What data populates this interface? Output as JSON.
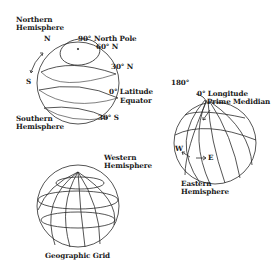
{
  "diagram": {
    "latitude_globe": {
      "northern_hemisphere_line1": "Northern",
      "northern_hemisphere_line2": "Hemisphere",
      "n_label": "N",
      "s_label": "S",
      "north_pole_deg": "90°",
      "north_pole": "North Pole",
      "lat_60": "60° N",
      "lat_30n": "30° N",
      "equator_deg": "0° Latitude",
      "equator": "Equator",
      "lat_30s": "30° S",
      "southern_hemisphere_line1": "Southern",
      "southern_hemisphere_line2": "Hemisphere"
    },
    "longitude_globe": {
      "lon_180": "180°",
      "lon_0": "0° Longitude",
      "prime_meridian": "Prime Medidian",
      "w_label": "W",
      "e_label": "E",
      "western_hemisphere_line1": "Western",
      "western_hemisphere_line2": "Hemisphere",
      "eastern_hemisphere_line1": "Eastern",
      "eastern_hemisphere_line2": "Hemisphere"
    },
    "grid_globe": {
      "caption": "Geographic Grid"
    },
    "colors": {
      "line": "#2a2a2a",
      "background": "#ffffff"
    }
  }
}
